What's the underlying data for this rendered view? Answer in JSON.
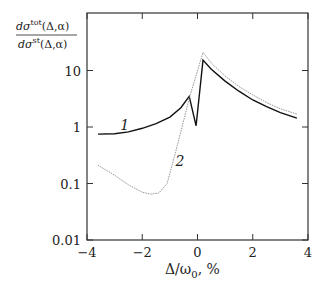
{
  "chart_data": {
    "type": "line",
    "title": "",
    "xlabel": "Δ/ω0 , %",
    "ylabel": "dσtot(Δ,α) / dσst(Δ,α)",
    "yscale": "log",
    "xlim": [
      -4,
      4
    ],
    "ylim": [
      0.01,
      100
    ],
    "xticks": [
      -4,
      -2,
      0,
      2,
      4
    ],
    "xtick_labels": [
      "−4",
      "−2",
      "0",
      "2",
      "4"
    ],
    "yticks": [
      0.01,
      0.1,
      1,
      10
    ],
    "ytick_labels": [
      "0.01",
      "0.1",
      "1",
      "10"
    ],
    "grid": false,
    "legend": "inline curve labels",
    "series": [
      {
        "name": "1",
        "style": "solid",
        "x": [
          -3.6,
          -3.0,
          -2.5,
          -2.0,
          -1.5,
          -1.0,
          -0.6,
          -0.3,
          -0.05,
          0.2,
          0.5,
          1.0,
          1.5,
          2.0,
          2.5,
          3.0,
          3.6
        ],
        "y": [
          0.75,
          0.76,
          0.82,
          0.95,
          1.15,
          1.5,
          2.2,
          3.5,
          1.05,
          15.3,
          10.5,
          6.5,
          4.3,
          3.0,
          2.3,
          1.8,
          1.44
        ]
      },
      {
        "name": "2",
        "style": "dotted",
        "x": [
          -3.6,
          -3.0,
          -2.5,
          -2.0,
          -1.7,
          -1.4,
          -1.1,
          -0.8,
          -0.5,
          -0.3,
          0.2,
          0.5,
          1.0,
          1.5,
          2.0,
          2.5,
          3.0,
          3.6
        ],
        "y": [
          0.21,
          0.14,
          0.095,
          0.07,
          0.065,
          0.068,
          0.1,
          0.35,
          1.3,
          3.2,
          21,
          13.5,
          8.0,
          5.2,
          3.7,
          2.7,
          2.1,
          1.7
        ]
      }
    ],
    "annotations": [
      {
        "text": "1",
        "x": -2.8,
        "y": 0.9
      },
      {
        "text": "2",
        "x": -0.8,
        "y": 0.2
      }
    ]
  },
  "axes": {
    "ylabel_num": "dσ",
    "ylabel_num_sup": "tot",
    "ylabel_num_arg": "(Δ,α)",
    "ylabel_den": "dσ",
    "ylabel_den_sup": "st",
    "ylabel_den_arg": "(Δ,α)",
    "xlabel": "Δ/ω",
    "xlabel_sub": "0",
    "xlabel_unit": ", %"
  }
}
